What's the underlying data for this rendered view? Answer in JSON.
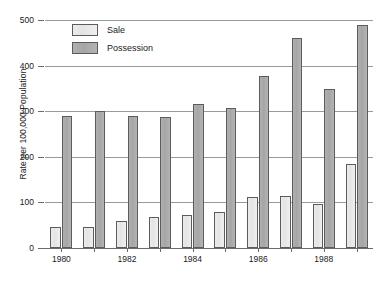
{
  "chart_data": {
    "type": "bar",
    "title": "",
    "subtitle": "",
    "xlabel": "",
    "ylabel": "Rate per 100,000 Population",
    "ylim": [
      0,
      500
    ],
    "ytick_values": [
      0,
      100,
      200,
      300,
      400,
      500
    ],
    "ytick_labels": [
      "0",
      "100",
      "200",
      "300",
      "400",
      "500"
    ],
    "grid": true,
    "grid_axis": "y",
    "legend_position": "upper-left-inside",
    "categories": [
      "1980",
      "1981",
      "1982",
      "1983",
      "1984",
      "1985",
      "1986",
      "1987",
      "1988",
      "1989"
    ],
    "xtick_labels_shown": [
      "1980",
      "",
      "1982",
      "",
      "1984",
      "",
      "1986",
      "",
      "1988",
      ""
    ],
    "series": [
      {
        "name": "Sale",
        "color": "#e8e8e8",
        "values": [
          45,
          45,
          60,
          68,
          72,
          80,
          112,
          113,
          97,
          185
        ]
      },
      {
        "name": "Possession",
        "color": "#a8a8a8",
        "values": [
          290,
          300,
          290,
          288,
          315,
          308,
          378,
          460,
          348,
          490
        ]
      }
    ]
  },
  "legend": {
    "items": [
      {
        "label": "Sale"
      },
      {
        "label": "Possession"
      }
    ]
  },
  "colors": {
    "sale": "#e8e8e8",
    "possession": "#a8a8a8",
    "bar_border": "#5c5c5c",
    "gridline": "#9a9a9a",
    "axis": "#6b6b6b",
    "text": "#1a1a1a",
    "background": "#ffffff"
  }
}
